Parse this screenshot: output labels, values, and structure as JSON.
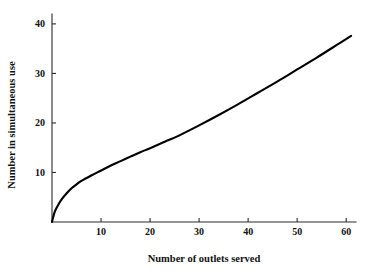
{
  "chart_data": {
    "type": "line",
    "title": "",
    "xlabel": "Number of outlets served",
    "ylabel": "Number in simultaneous use",
    "xlim": [
      0,
      62
    ],
    "ylim": [
      0,
      42
    ],
    "grid": false,
    "legend": null,
    "xticks": [
      10,
      20,
      30,
      40,
      50,
      60
    ],
    "xtick_labels": [
      "10",
      "20",
      "30",
      "40",
      "50",
      "60"
    ],
    "yticks": [
      10,
      20,
      30,
      40
    ],
    "ytick_labels": [
      "10",
      "20",
      "30",
      "40"
    ],
    "series": [
      {
        "name": "simultaneous use",
        "color": "#000000",
        "x": [
          0,
          0.5,
          1,
          2,
          3,
          4,
          5,
          6,
          8,
          10,
          12,
          14,
          16,
          18,
          20,
          23,
          26,
          30,
          34,
          38,
          42,
          46,
          50,
          54,
          58,
          61
        ],
        "y": [
          0,
          1.9,
          3.0,
          4.6,
          5.8,
          6.8,
          7.6,
          8.3,
          9.4,
          10.4,
          11.4,
          12.3,
          13.2,
          14.1,
          14.9,
          16.2,
          17.5,
          19.5,
          21.6,
          23.8,
          26.1,
          28.4,
          30.8,
          33.2,
          35.7,
          37.6
        ]
      }
    ]
  }
}
